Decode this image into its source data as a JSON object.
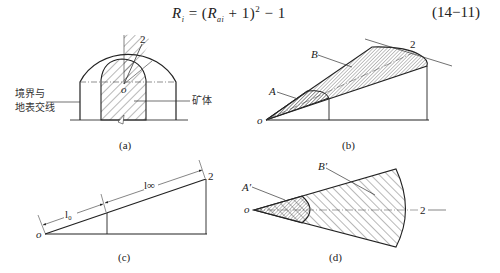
{
  "equation": {
    "lhs_symbol": "R",
    "lhs_sub": "i",
    "eq": " = (",
    "rhs_symbol": "R",
    "rhs_sub": "ai",
    "rhs_tail": " + 1)",
    "power": "2",
    "minus": " − 1",
    "number": "(14−11)"
  },
  "figures": {
    "a": {
      "caption": "(a)",
      "label_left_line1": "境界与",
      "label_left_line2": "地表交线",
      "label_right": "矿体",
      "point_2": "2",
      "point_o": "o"
    },
    "b": {
      "caption": "(b)",
      "label_A": "A",
      "label_B": "B",
      "point_2": "2",
      "point_o": "o"
    },
    "c": {
      "caption": "(c)",
      "dim_l0": "l₀",
      "dim_linf": "l∞",
      "point_2": "2",
      "point_o": "o"
    },
    "d": {
      "caption": "(d)",
      "label_A": "A′",
      "label_B": "B′",
      "point_2": "2",
      "point_o": "o"
    }
  }
}
